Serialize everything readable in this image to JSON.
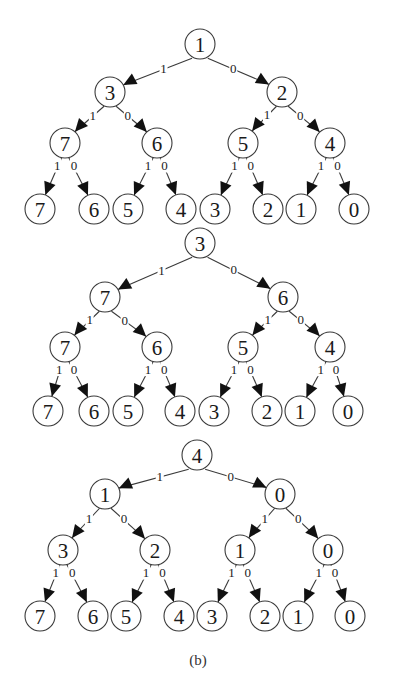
{
  "figure": {
    "caption": "(b)",
    "colors": {
      "stroke": "#3a3a3a",
      "arrow": "#111111",
      "text": "#1a1a1a",
      "background": "#ffffff"
    },
    "node_radius": 15,
    "leaf_radius": 15,
    "edge_labels": {
      "left": "1",
      "right": "0"
    }
  },
  "trees": [
    {
      "name": "tree-1",
      "levels": [
        {
          "y": 44,
          "nodes": [
            {
              "x": 200,
              "label": "1"
            }
          ]
        },
        {
          "y": 92,
          "nodes": [
            {
              "x": 110,
              "label": "3"
            },
            {
              "x": 282,
              "label": "2"
            }
          ]
        },
        {
          "y": 143,
          "nodes": [
            {
              "x": 65,
              "label": "7"
            },
            {
              "x": 157,
              "label": "6"
            },
            {
              "x": 243,
              "label": "5"
            },
            {
              "x": 330,
              "label": "4"
            }
          ]
        },
        {
          "y": 209,
          "nodes": [
            {
              "x": 40,
              "label": "7"
            },
            {
              "x": 94,
              "label": "6"
            },
            {
              "x": 128,
              "label": "5"
            },
            {
              "x": 181,
              "label": "4"
            },
            {
              "x": 215,
              "label": "3"
            },
            {
              "x": 268,
              "label": "2"
            },
            {
              "x": 301,
              "label": "1"
            },
            {
              "x": 354,
              "label": "0"
            }
          ]
        }
      ]
    },
    {
      "name": "tree-2",
      "levels": [
        {
          "y": 243,
          "nodes": [
            {
              "x": 200,
              "label": "3"
            }
          ]
        },
        {
          "y": 297,
          "nodes": [
            {
              "x": 105,
              "label": "7"
            },
            {
              "x": 283,
              "label": "6"
            }
          ]
        },
        {
          "y": 347,
          "nodes": [
            {
              "x": 65,
              "label": "7"
            },
            {
              "x": 157,
              "label": "6"
            },
            {
              "x": 243,
              "label": "5"
            },
            {
              "x": 330,
              "label": "4"
            }
          ]
        },
        {
          "y": 411,
          "nodes": [
            {
              "x": 48,
              "label": "7"
            },
            {
              "x": 94,
              "label": "6"
            },
            {
              "x": 128,
              "label": "5"
            },
            {
              "x": 180,
              "label": "4"
            },
            {
              "x": 214,
              "label": "3"
            },
            {
              "x": 267,
              "label": "2"
            },
            {
              "x": 300,
              "label": "1"
            },
            {
              "x": 348,
              "label": "0"
            }
          ]
        }
      ]
    },
    {
      "name": "tree-3",
      "levels": [
        {
          "y": 455,
          "nodes": [
            {
              "x": 197,
              "label": "4"
            }
          ]
        },
        {
          "y": 494,
          "nodes": [
            {
              "x": 105,
              "label": "1"
            },
            {
              "x": 280,
              "label": "0"
            }
          ]
        },
        {
          "y": 550,
          "nodes": [
            {
              "x": 63,
              "label": "3"
            },
            {
              "x": 155,
              "label": "2"
            },
            {
              "x": 240,
              "label": "1"
            },
            {
              "x": 328,
              "label": "0"
            }
          ]
        },
        {
          "y": 616,
          "nodes": [
            {
              "x": 40,
              "label": "7"
            },
            {
              "x": 93,
              "label": "6"
            },
            {
              "x": 126,
              "label": "5"
            },
            {
              "x": 179,
              "label": "4"
            },
            {
              "x": 212,
              "label": "3"
            },
            {
              "x": 265,
              "label": "2"
            },
            {
              "x": 298,
              "label": "1"
            },
            {
              "x": 350,
              "label": "0"
            }
          ]
        }
      ]
    }
  ]
}
